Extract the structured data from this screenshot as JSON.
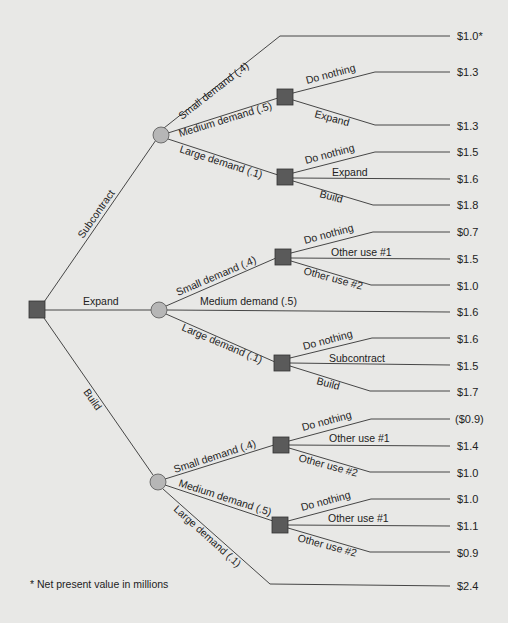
{
  "diagram": {
    "type": "decision-tree",
    "root": {
      "node_type": "decision",
      "branches": [
        {
          "label": "Subcontract",
          "node_type": "chance",
          "branches": [
            {
              "label": "Small demand (.4)",
              "payoff": "$1.0*"
            },
            {
              "label": "Medium demand (.5)",
              "node_type": "decision",
              "branches": [
                {
                  "label": "Do nothing",
                  "payoff": "$1.3"
                },
                {
                  "label": "Expand",
                  "payoff": "$1.3"
                }
              ]
            },
            {
              "label": "Large demand (.1)",
              "node_type": "decision",
              "branches": [
                {
                  "label": "Do nothing",
                  "payoff": "$1.5"
                },
                {
                  "label": "Expand",
                  "payoff": "$1.6"
                },
                {
                  "label": "Build",
                  "payoff": "$1.8"
                }
              ]
            }
          ]
        },
        {
          "label": "Expand",
          "node_type": "chance",
          "branches": [
            {
              "label": "Small demand (.4)",
              "node_type": "decision",
              "branches": [
                {
                  "label": "Do nothing",
                  "payoff": "$0.7"
                },
                {
                  "label": "Other use #1",
                  "payoff": "$1.5"
                },
                {
                  "label": "Other use #2",
                  "payoff": "$1.0"
                }
              ]
            },
            {
              "label": "Medium demand (.5)",
              "payoff": "$1.6"
            },
            {
              "label": "Large demand (.1)",
              "node_type": "decision",
              "branches": [
                {
                  "label": "Do nothing",
                  "payoff": "$1.6"
                },
                {
                  "label": "Subcontract",
                  "payoff": "$1.5"
                },
                {
                  "label": "Build",
                  "payoff": "$1.7"
                }
              ]
            }
          ]
        },
        {
          "label": "Build",
          "node_type": "chance",
          "branches": [
            {
              "label": "Small demand (.4)",
              "node_type": "decision",
              "branches": [
                {
                  "label": "Do nothing",
                  "payoff": "($0.9)"
                },
                {
                  "label": "Other use #1",
                  "payoff": "$1.4"
                },
                {
                  "label": "Other use #2",
                  "payoff": "$1.0"
                }
              ]
            },
            {
              "label": "Medium demand (.5)",
              "node_type": "decision",
              "branches": [
                {
                  "label": "Do nothing",
                  "payoff": "$1.0"
                },
                {
                  "label": "Other use #1",
                  "payoff": "$1.1"
                },
                {
                  "label": "Other use #2",
                  "payoff": "$0.9"
                }
              ]
            },
            {
              "label": "Large demand (.1)",
              "payoff": "$2.4"
            }
          ]
        }
      ]
    },
    "footnote": "* Net present value in millions",
    "colors": {
      "background": "#e8e8e6",
      "decision_node": "#5a5a5a",
      "chance_node": "#b6b6b6",
      "line": "#333333"
    }
  }
}
